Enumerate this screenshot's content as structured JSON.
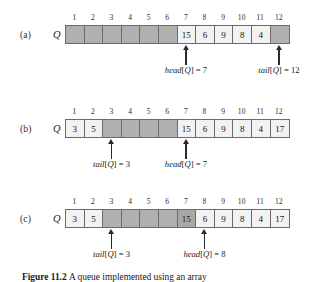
{
  "figure": {
    "caption_label": "Figure 11.2",
    "caption_text": "A queue implemented using an array",
    "indices": [
      "1",
      "2",
      "3",
      "4",
      "5",
      "6",
      "7",
      "8",
      "9",
      "10",
      "11",
      "12"
    ],
    "array_variable": "Q",
    "colors": {
      "empty_slot": "#b0b0b0",
      "filled_slot": "#f2f2f2",
      "shaded_slot": "#a8a8a8",
      "border": "#6b6b6b",
      "text": "#141414",
      "arrow": "#2b2b2b"
    }
  },
  "panels": [
    {
      "letter": "(a)",
      "slots": [
        {
          "value": "",
          "state": "empty"
        },
        {
          "value": "",
          "state": "empty"
        },
        {
          "value": "",
          "state": "empty"
        },
        {
          "value": "",
          "state": "empty"
        },
        {
          "value": "",
          "state": "empty"
        },
        {
          "value": "",
          "state": "empty"
        },
        {
          "value": "15",
          "state": "filled"
        },
        {
          "value": "6",
          "state": "filled"
        },
        {
          "value": "9",
          "state": "filled"
        },
        {
          "value": "8",
          "state": "filled"
        },
        {
          "value": "4",
          "state": "filled"
        },
        {
          "value": "",
          "state": "empty"
        }
      ],
      "pointers": [
        {
          "name": "head",
          "bracket_open": "[",
          "variable": "Q",
          "bracket_close": "]",
          "equals": " = ",
          "value": "7",
          "index": 7
        },
        {
          "name": "tail",
          "bracket_open": "[",
          "variable": "Q",
          "bracket_close": "]",
          "equals": " = ",
          "value": "12",
          "index": 12
        }
      ]
    },
    {
      "letter": "(b)",
      "slots": [
        {
          "value": "3",
          "state": "filled"
        },
        {
          "value": "5",
          "state": "filled"
        },
        {
          "value": "",
          "state": "empty"
        },
        {
          "value": "",
          "state": "empty"
        },
        {
          "value": "",
          "state": "empty"
        },
        {
          "value": "",
          "state": "empty"
        },
        {
          "value": "15",
          "state": "filled"
        },
        {
          "value": "6",
          "state": "filled"
        },
        {
          "value": "9",
          "state": "filled"
        },
        {
          "value": "8",
          "state": "filled"
        },
        {
          "value": "4",
          "state": "filled"
        },
        {
          "value": "17",
          "state": "filled"
        }
      ],
      "pointers": [
        {
          "name": "tail",
          "bracket_open": "[",
          "variable": "Q",
          "bracket_close": "]",
          "equals": " = ",
          "value": "3",
          "index": 3
        },
        {
          "name": "head",
          "bracket_open": "[",
          "variable": "Q",
          "bracket_close": "]",
          "equals": " = ",
          "value": "7",
          "index": 7
        }
      ]
    },
    {
      "letter": "(c)",
      "slots": [
        {
          "value": "3",
          "state": "filled"
        },
        {
          "value": "5",
          "state": "filled"
        },
        {
          "value": "",
          "state": "empty"
        },
        {
          "value": "",
          "state": "empty"
        },
        {
          "value": "",
          "state": "empty"
        },
        {
          "value": "",
          "state": "empty"
        },
        {
          "value": "15",
          "state": "shaded"
        },
        {
          "value": "6",
          "state": "filled"
        },
        {
          "value": "9",
          "state": "filled"
        },
        {
          "value": "8",
          "state": "filled"
        },
        {
          "value": "4",
          "state": "filled"
        },
        {
          "value": "17",
          "state": "filled"
        }
      ],
      "pointers": [
        {
          "name": "tail",
          "bracket_open": "[",
          "variable": "Q",
          "bracket_close": "]",
          "equals": " = ",
          "value": "3",
          "index": 3
        },
        {
          "name": "head",
          "bracket_open": "[",
          "variable": "Q",
          "bracket_close": "]",
          "equals": " = ",
          "value": "8",
          "index": 8
        }
      ]
    }
  ]
}
